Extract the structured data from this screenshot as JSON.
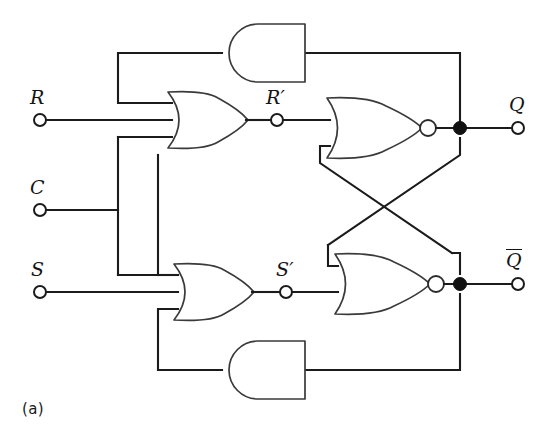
{
  "figure": {
    "caption": "(a)",
    "background_color": "#ffffff",
    "line_color": "#1b1b1b"
  },
  "inputs": [
    {
      "name": "input-r",
      "label": "R",
      "terminal": "open-circle",
      "x": 40,
      "y": 120
    },
    {
      "name": "input-c",
      "label": "C",
      "terminal": "open-circle",
      "x": 40,
      "y": 210
    },
    {
      "name": "input-s",
      "label": "S",
      "terminal": "open-circle",
      "x": 40,
      "y": 292
    }
  ],
  "internal_nodes": [
    {
      "name": "node-r-prime",
      "label": "R′",
      "terminal": "open-circle",
      "x": 277,
      "y": 120
    },
    {
      "name": "node-s-prime",
      "label": "S′",
      "terminal": "open-circle",
      "x": 286,
      "y": 292
    }
  ],
  "outputs": [
    {
      "name": "output-q",
      "label": "Q",
      "overline": false,
      "terminal": "open-circle",
      "x": 518,
      "y": 128
    },
    {
      "name": "output-q-bar",
      "label": "Q",
      "overline": true,
      "terminal": "open-circle",
      "x": 518,
      "y": 284
    }
  ],
  "gates": [
    {
      "name": "and-gate-top",
      "type": "AND",
      "orientation": "mirrored-left",
      "inputs": 1,
      "output_bubble": false
    },
    {
      "name": "or-gate-top",
      "type": "OR",
      "orientation": "normal",
      "inputs": 3,
      "output_bubble": false
    },
    {
      "name": "nor-gate-top",
      "type": "NOR",
      "orientation": "normal",
      "inputs": 2,
      "output_bubble": true
    },
    {
      "name": "or-gate-bottom",
      "type": "OR",
      "orientation": "normal",
      "inputs": 3,
      "output_bubble": false
    },
    {
      "name": "nor-gate-bottom",
      "type": "NOR",
      "orientation": "normal",
      "inputs": 2,
      "output_bubble": true
    },
    {
      "name": "and-gate-bottom",
      "type": "AND",
      "orientation": "mirrored-left",
      "inputs": 1,
      "output_bubble": false
    }
  ],
  "junctions": [
    {
      "name": "junction-q",
      "x": 460,
      "y": 128
    },
    {
      "name": "junction-q-bar",
      "x": 460,
      "y": 284
    }
  ]
}
